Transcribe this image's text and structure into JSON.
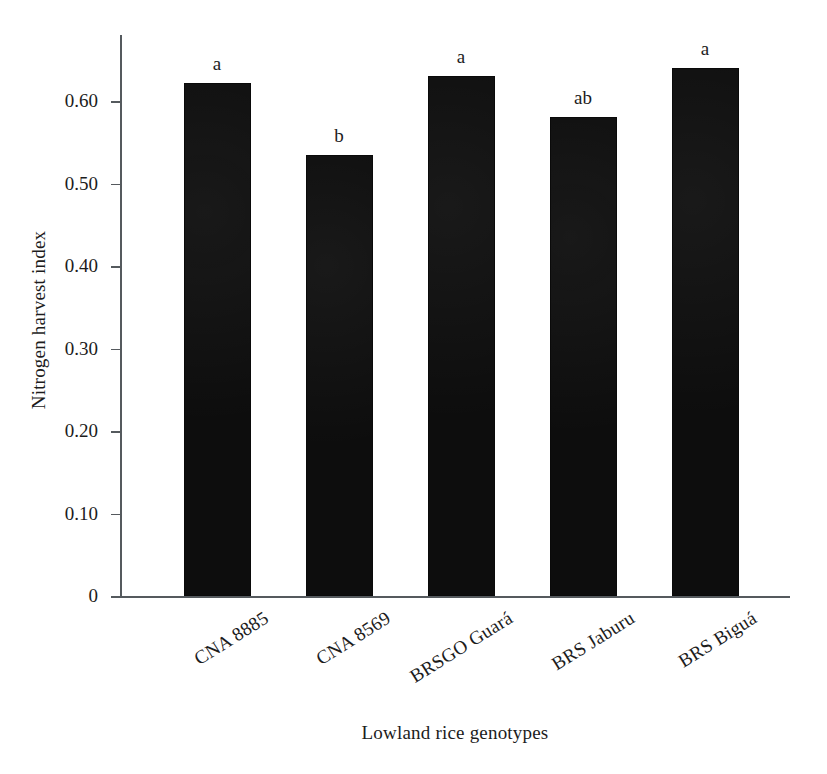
{
  "chart_data": {
    "type": "bar",
    "title": "",
    "xlabel": "Lowland rice genotypes",
    "ylabel": "Nitrogen harvest index",
    "categories": [
      "CNA 8885",
      "CNA 8569",
      "BRSGO Guará",
      "BRS Jaburu",
      "BRS Biguá"
    ],
    "values": [
      0.622,
      0.534,
      0.63,
      0.581,
      0.64
    ],
    "annotations": [
      "a",
      "b",
      "a",
      "ab",
      "a"
    ],
    "ylim": [
      0,
      0.68
    ],
    "ytick_values": [
      0,
      0.1,
      0.2,
      0.3,
      0.4,
      0.5,
      0.6
    ],
    "ytick_labels": [
      "0",
      "0.10",
      "0.20",
      "0.30",
      "0.40",
      "0.50",
      "0.60"
    ],
    "grid": false,
    "legend": null,
    "bar_color": "#0d0d0d",
    "axis_color": "#555a5e",
    "text_color": "#1c1c1c"
  }
}
